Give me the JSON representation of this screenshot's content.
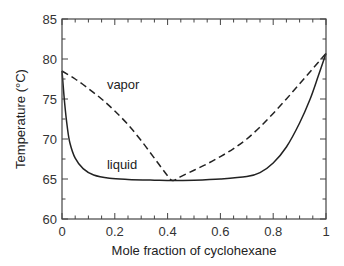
{
  "chart_data": {
    "type": "line",
    "title": "",
    "xlabel": "Mole fraction of cyclohexane",
    "ylabel": "Temperature (°C)",
    "xlim": [
      0,
      1
    ],
    "ylim": [
      60,
      85
    ],
    "xticks": [
      0,
      0.2,
      0.4,
      0.6,
      0.8,
      1
    ],
    "xtick_labels": [
      "0",
      "0.2",
      "0.4",
      "0.6",
      "0.8",
      "1"
    ],
    "yticks": [
      60,
      65,
      70,
      75,
      80,
      85
    ],
    "ytick_labels": [
      "60",
      "65",
      "70",
      "75",
      "80",
      "85"
    ],
    "x_minor_step": 0.05,
    "y_minor_step": 2.5,
    "grid": false,
    "series": [
      {
        "name": "vapor",
        "style": "dashed",
        "x": [
          0,
          0.05,
          0.1,
          0.15,
          0.2,
          0.25,
          0.3,
          0.35,
          0.4,
          0.42,
          0.45,
          0.5,
          0.55,
          0.6,
          0.65,
          0.7,
          0.75,
          0.8,
          0.85,
          0.9,
          0.95,
          1.0
        ],
        "y": [
          78.5,
          77.5,
          76.3,
          75.0,
          73.5,
          71.8,
          69.8,
          67.6,
          65.4,
          64.8,
          65.3,
          66.1,
          66.9,
          67.8,
          68.8,
          70.0,
          71.5,
          73.2,
          75.0,
          76.9,
          78.8,
          80.7
        ]
      },
      {
        "name": "liquid",
        "style": "solid",
        "x": [
          0,
          0.01,
          0.02,
          0.03,
          0.05,
          0.08,
          0.12,
          0.18,
          0.25,
          0.35,
          0.42,
          0.5,
          0.6,
          0.7,
          0.75,
          0.8,
          0.85,
          0.9,
          0.94,
          0.97,
          1.0
        ],
        "y": [
          78.5,
          74.5,
          71.5,
          69.5,
          67.6,
          66.3,
          65.5,
          65.1,
          64.95,
          64.85,
          64.8,
          64.85,
          65.0,
          65.3,
          65.8,
          67.0,
          69.0,
          72.0,
          75.0,
          77.8,
          80.7
        ]
      }
    ],
    "annotations": [
      {
        "text": "vapor",
        "x": 0.17,
        "y": 76.2
      },
      {
        "text": "liquid",
        "x": 0.17,
        "y": 66.2
      }
    ],
    "legend": "none"
  }
}
